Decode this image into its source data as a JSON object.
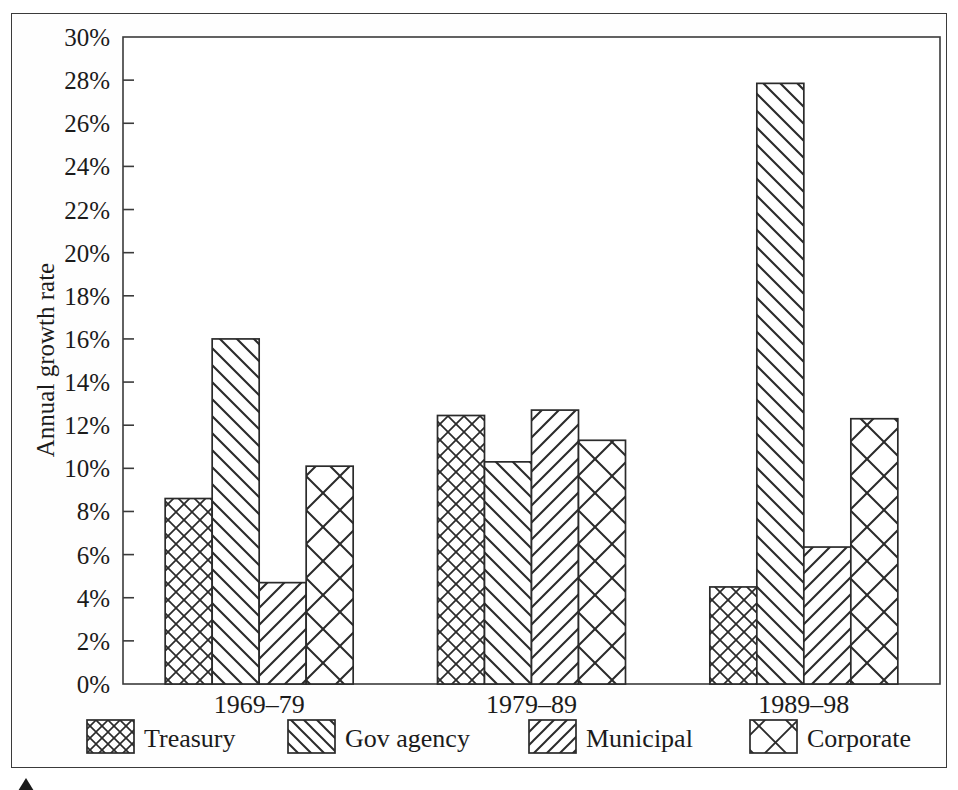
{
  "figure": {
    "background_color": "#ffffff",
    "frame_color": "#3b3b3b",
    "ink_color": "#1b1b1b"
  },
  "chart_data": {
    "type": "bar",
    "title": "",
    "subtitle": "",
    "xlabel": "",
    "ylabel": "Annual growth rate",
    "categories": [
      "1969–79",
      "1979–89",
      "1989–98"
    ],
    "series": [
      {
        "name": "Treasury",
        "pattern": "fine-cross-hatch",
        "values": [
          8.6,
          12.45,
          4.5
        ]
      },
      {
        "name": "Gov agency",
        "pattern": "backslash-diagonal",
        "values": [
          16.0,
          10.3,
          27.85
        ]
      },
      {
        "name": "Municipal",
        "pattern": "forward-slash-diagonal",
        "values": [
          4.7,
          12.7,
          6.35
        ]
      },
      {
        "name": "Corporate",
        "pattern": "coarse-cross-hatch",
        "values": [
          10.1,
          11.3,
          12.3
        ]
      }
    ],
    "ylim": [
      0,
      30
    ],
    "ytick_values": [
      0,
      2,
      4,
      6,
      8,
      10,
      12,
      14,
      16,
      18,
      20,
      22,
      24,
      26,
      28,
      30
    ],
    "ytick_labels": [
      "0%",
      "2%",
      "4%",
      "6%",
      "8%",
      "10%",
      "12%",
      "14%",
      "16%",
      "18%",
      "20%",
      "22%",
      "24%",
      "26%",
      "28%",
      "30%"
    ],
    "y_unit": "%",
    "grid": false,
    "legend_position": "bottom",
    "legend_entries": [
      "Treasury",
      "Gov agency",
      "Municipal",
      "Corporate"
    ]
  },
  "caption": {
    "text": "",
    "visible": "partially cut off at bottom edge"
  }
}
